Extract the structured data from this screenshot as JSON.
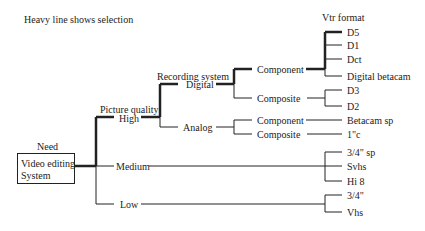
{
  "caption": "Heavy line shows selection",
  "root": {
    "heading": "Need",
    "line1": "Video editing",
    "line2": "System"
  },
  "levels": {
    "quality_heading": "Picture quality",
    "recording_heading": "Recording system",
    "format_heading": "Vtr format"
  },
  "quality": {
    "high": "High",
    "medium": "Medium",
    "low": "Low"
  },
  "recording": {
    "digital": "Digital",
    "analog": "Analog"
  },
  "signal": {
    "digital_component": "Component",
    "digital_composite": "Composite",
    "analog_component": "Component",
    "analog_composite": "Composite"
  },
  "formats": {
    "digital_component": [
      "D5",
      "D1",
      "Dct",
      "Digital betacam"
    ],
    "digital_composite": [
      "D3",
      "D2"
    ],
    "analog_component": [
      "Betacam sp"
    ],
    "analog_composite": [
      "1\"c"
    ],
    "medium": [
      "3/4\" sp",
      "Svhs",
      "Hi 8"
    ],
    "low": [
      "3/4\"",
      "Vhs"
    ]
  },
  "selection_path": [
    "Video editing System",
    "High",
    "Digital",
    "Component",
    "D5"
  ],
  "colors": {
    "line": "#222222",
    "background": "#ffffff"
  }
}
